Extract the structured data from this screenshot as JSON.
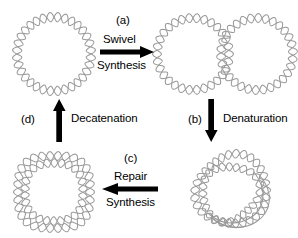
{
  "figure": {
    "background_color": "#ffffff",
    "strand_color": "#9a9a9a",
    "arrow_color": "#000000",
    "text_color": "#000000",
    "width": 298,
    "height": 238
  },
  "steps": [
    {
      "id": "a",
      "label": "(a)",
      "arrow_direction": "right",
      "text_above": "Swivel",
      "text_below": "Synthesis",
      "from_structure": "parental-circular-duplex",
      "to_structure": "replicated-figure-eight"
    },
    {
      "id": "b",
      "label": "(b)",
      "arrow_direction": "down",
      "text_above": "",
      "text_beside": "Denaturation",
      "from_structure": "replicated-figure-eight",
      "to_structure": "denatured-catenane"
    },
    {
      "id": "c",
      "label": "(c)",
      "arrow_direction": "left",
      "text_above": "Repair",
      "text_below": "Synthesis",
      "from_structure": "denatured-catenane",
      "to_structure": "catenated-dimer"
    },
    {
      "id": "d",
      "label": "(d)",
      "arrow_direction": "up",
      "text_beside": "Decatenation",
      "from_structure": "catenated-dimer",
      "to_structure": "parental-circular-duplex"
    }
  ],
  "structures": [
    {
      "id": "parental-circular-duplex",
      "name": "Circular duplex DNA",
      "position": "top-left"
    },
    {
      "id": "replicated-figure-eight",
      "name": "Figure-eight replication intermediate",
      "position": "top-right"
    },
    {
      "id": "denatured-catenane",
      "name": "Denatured catenane with single-strand region",
      "position": "bottom-right"
    },
    {
      "id": "catenated-dimer",
      "name": "Catenated duplex dimer",
      "position": "bottom-left"
    }
  ]
}
